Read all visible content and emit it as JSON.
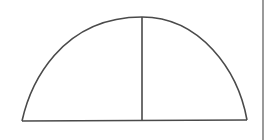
{
  "diagram": {
    "type": "semi-ellipse-with-vertical-divider",
    "stroke_color": "#4a4a4a",
    "stroke_width": 1.6,
    "base": {
      "x1": 22,
      "y1": 121,
      "x2": 247,
      "y2": 120
    },
    "apex": {
      "x": 142,
      "y": 17
    },
    "divider": {
      "x1": 142,
      "y1": 17,
      "x2": 142,
      "y2": 121
    }
  },
  "edge_bar": {
    "color": "#9a9a9a"
  }
}
